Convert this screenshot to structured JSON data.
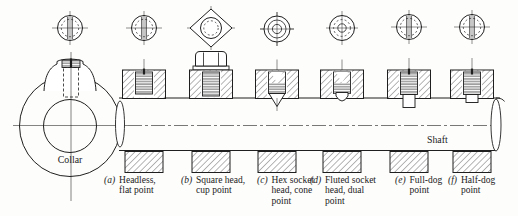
{
  "collar": {
    "label": "Collar"
  },
  "shaft": {
    "label": "Shaft"
  },
  "captions": {
    "a": {
      "letter": "(a)",
      "line1": "Headless,",
      "line2": "flat point"
    },
    "b": {
      "letter": "(b)",
      "line1": "Square head,",
      "line2": "cup point"
    },
    "c": {
      "letter": "(c)",
      "line1": "Hex socket",
      "line2": "head, cone",
      "line3": "point"
    },
    "d": {
      "letter": "(d)",
      "line1": "Fluted socket",
      "line2": "head, dual",
      "line3": "point"
    },
    "e": {
      "letter": "(e)",
      "line1": "Full-dog",
      "line2": "point"
    },
    "f": {
      "letter": "(f)",
      "line1": "Half-dog",
      "line2": "point"
    }
  },
  "colors": {
    "ink": "#1f1f1f",
    "paper": "#fdfdfb"
  }
}
